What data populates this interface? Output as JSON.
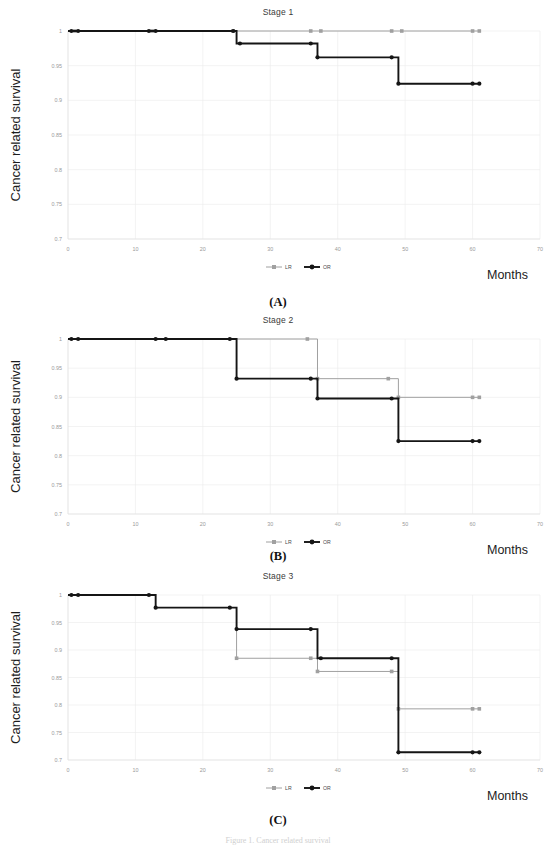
{
  "figure": {
    "caption": "Figure 1. Cancer related survival",
    "y_axis_label": "Cancer related survival",
    "x_axis_label": "Months",
    "legend": [
      {
        "key": "LR",
        "label": "LR",
        "color": "#a0a0a0"
      },
      {
        "key": "OR",
        "label": "OR",
        "color": "#151515"
      }
    ]
  },
  "panels": [
    {
      "letter": "(A)",
      "title": "Stage 1"
    },
    {
      "letter": "(B)",
      "title": "Stage 2"
    },
    {
      "letter": "(C)",
      "title": "Stage 3"
    }
  ],
  "chart_data": [
    {
      "type": "line",
      "title": "Stage 1",
      "panel": "(A)",
      "xlabel": "Months",
      "ylabel": "Cancer related survival",
      "xlim": [
        0,
        70
      ],
      "ylim": [
        0.7,
        1
      ],
      "xticks": [
        0,
        10,
        20,
        30,
        40,
        50,
        60,
        70
      ],
      "yticks": [
        0.7,
        0.75,
        0.8,
        0.85,
        0.9,
        0.95,
        1
      ],
      "grid": true,
      "legend_position": "bottom",
      "series": [
        {
          "name": "LR",
          "color": "#a0a0a0",
          "steps": [
            {
              "x": 0,
              "y": 1
            },
            {
              "x": 25,
              "y": 1
            },
            {
              "x": 36,
              "y": 1
            },
            {
              "x": 48,
              "y": 1
            },
            {
              "x": 61,
              "y": 1
            }
          ],
          "censor_marks": [
            1,
            12.5,
            24.5,
            36,
            37.5,
            48,
            49.5,
            60,
            61
          ]
        },
        {
          "name": "OR",
          "color": "#151515",
          "steps": [
            {
              "x": 0,
              "y": 1
            },
            {
              "x": 25,
              "y": 1
            },
            {
              "x": 25,
              "y": 0.982
            },
            {
              "x": 37,
              "y": 0.982
            },
            {
              "x": 37,
              "y": 0.962
            },
            {
              "x": 49,
              "y": 0.962
            },
            {
              "x": 49,
              "y": 0.924
            },
            {
              "x": 61,
              "y": 0.924
            }
          ],
          "censor_marks": [
            0.5,
            1.5,
            12,
            13,
            24.5,
            25.5,
            36,
            37,
            48,
            49,
            60,
            61
          ]
        }
      ]
    },
    {
      "type": "line",
      "title": "Stage 2",
      "panel": "(B)",
      "xlabel": "Months",
      "ylabel": "Cancer related survival",
      "xlim": [
        0,
        70
      ],
      "ylim": [
        0.7,
        1
      ],
      "xticks": [
        0,
        10,
        20,
        30,
        40,
        50,
        60,
        70
      ],
      "yticks": [
        0.7,
        0.75,
        0.8,
        0.85,
        0.9,
        0.95,
        1
      ],
      "grid": true,
      "legend_position": "bottom",
      "series": [
        {
          "name": "LR",
          "color": "#a0a0a0",
          "steps": [
            {
              "x": 0,
              "y": 1
            },
            {
              "x": 37,
              "y": 1
            },
            {
              "x": 37,
              "y": 0.932
            },
            {
              "x": 49,
              "y": 0.932
            },
            {
              "x": 49,
              "y": 0.9
            },
            {
              "x": 61,
              "y": 0.9
            }
          ],
          "censor_marks": [
            35.5,
            37,
            47.5,
            49,
            60,
            61
          ]
        },
        {
          "name": "OR",
          "color": "#151515",
          "steps": [
            {
              "x": 0,
              "y": 1
            },
            {
              "x": 25,
              "y": 1
            },
            {
              "x": 25,
              "y": 0.932
            },
            {
              "x": 37,
              "y": 0.932
            },
            {
              "x": 37,
              "y": 0.898
            },
            {
              "x": 49,
              "y": 0.898
            },
            {
              "x": 49,
              "y": 0.825
            },
            {
              "x": 61,
              "y": 0.825
            }
          ],
          "censor_marks": [
            0.5,
            1.5,
            13,
            14.5,
            24,
            25,
            36,
            37,
            48,
            49,
            60,
            61
          ]
        }
      ]
    },
    {
      "type": "line",
      "title": "Stage 3",
      "panel": "(C)",
      "xlabel": "Months",
      "ylabel": "Cancer related survival",
      "xlim": [
        0,
        70
      ],
      "ylim": [
        0.7,
        1
      ],
      "xticks": [
        0,
        10,
        20,
        30,
        40,
        50,
        60,
        70
      ],
      "yticks": [
        0.7,
        0.75,
        0.8,
        0.85,
        0.9,
        0.95,
        1
      ],
      "grid": true,
      "legend_position": "bottom",
      "series": [
        {
          "name": "LR",
          "color": "#a0a0a0",
          "steps": [
            {
              "x": 25,
              "y": 0.938
            },
            {
              "x": 25,
              "y": 0.885
            },
            {
              "x": 37,
              "y": 0.885
            },
            {
              "x": 37,
              "y": 0.861
            },
            {
              "x": 49,
              "y": 0.861
            },
            {
              "x": 49,
              "y": 0.793
            },
            {
              "x": 61,
              "y": 0.793
            }
          ],
          "censor_marks": [
            25,
            36,
            37,
            48,
            49,
            60,
            61
          ]
        },
        {
          "name": "OR",
          "color": "#151515",
          "steps": [
            {
              "x": 0,
              "y": 1
            },
            {
              "x": 13,
              "y": 1
            },
            {
              "x": 13,
              "y": 0.977
            },
            {
              "x": 25,
              "y": 0.977
            },
            {
              "x": 25,
              "y": 0.938
            },
            {
              "x": 37,
              "y": 0.938
            },
            {
              "x": 37,
              "y": 0.885
            },
            {
              "x": 49,
              "y": 0.885
            },
            {
              "x": 49,
              "y": 0.714
            },
            {
              "x": 61,
              "y": 0.714
            }
          ],
          "censor_marks": [
            0.5,
            1.5,
            12,
            13,
            24,
            25,
            36,
            37.5,
            48,
            49,
            60,
            61
          ]
        }
      ]
    }
  ]
}
